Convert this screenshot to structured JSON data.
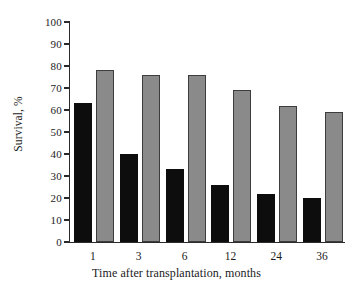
{
  "chart_data": {
    "type": "bar",
    "title": "",
    "xlabel": "Time after transplantation, months",
    "ylabel": "Survival, %",
    "categories": [
      "1",
      "3",
      "6",
      "12",
      "24",
      "36"
    ],
    "ylim": [
      0,
      100
    ],
    "yticks": [
      0,
      10,
      20,
      30,
      40,
      50,
      60,
      70,
      80,
      90,
      100
    ],
    "ytick_labels": [
      "0",
      "10",
      "20",
      "30",
      "40",
      "50",
      "60",
      "70",
      "80",
      "90",
      "100"
    ],
    "grid": false,
    "legend": "none",
    "series": [
      {
        "name": "black-series",
        "color": "#0d0d0d",
        "values": [
          63,
          40,
          33,
          26,
          22,
          20
        ]
      },
      {
        "name": "gray-series",
        "color": "#8a8a8a",
        "values": [
          78,
          76,
          76,
          69,
          62,
          59
        ]
      }
    ]
  }
}
